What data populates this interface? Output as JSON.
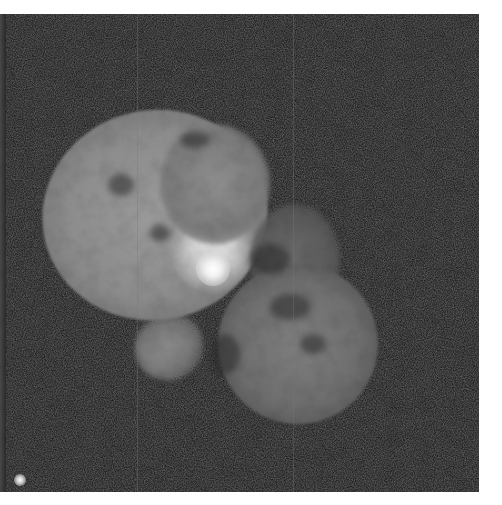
{
  "image": {
    "subject": "Homunculus nebula around a bright central star",
    "style": "grayscale astronomical photograph",
    "colors": {
      "background_border": "#ffffff",
      "sky": "#232323",
      "nebula_bright": "#9a9a9a",
      "nebula_dim": "#6e6e6e",
      "core": "#ffffff"
    },
    "features": [
      {
        "name": "upper-left-lobe",
        "approx_center": [
          155,
          215
        ]
      },
      {
        "name": "lower-right-lobe",
        "approx_center": [
          298,
          330
        ]
      },
      {
        "name": "central-star",
        "approx_center": [
          213,
          255
        ]
      },
      {
        "name": "lower-left-jet",
        "approx_center": [
          168,
          334
        ]
      },
      {
        "name": "field-star",
        "approx_center": [
          20,
          480
        ]
      }
    ]
  }
}
